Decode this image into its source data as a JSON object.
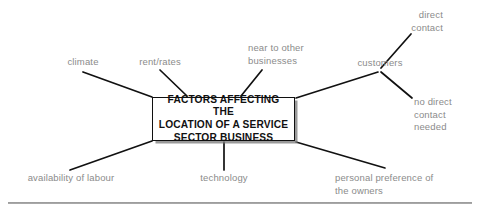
{
  "diagram": {
    "title": "Factors affecting the location of a service sector business",
    "type": "spider-mind-map",
    "center": {
      "label": "FACTORS AFFECTING THE\nLOCATION OF A SERVICE\nSECTOR BUSINESS",
      "style": "bold-uppercase-boxed-with-shadow"
    },
    "branches": [
      {
        "id": "climate",
        "label": "climate",
        "align": "center"
      },
      {
        "id": "rent-rates",
        "label": "rent/rates",
        "align": "center"
      },
      {
        "id": "near-to-other-businesses",
        "label": "near to other\nbusinesses",
        "align": "left"
      },
      {
        "id": "customers",
        "label": "customers",
        "align": "center"
      },
      {
        "id": "direct-contact",
        "label": "direct\ncontact",
        "align": "right"
      },
      {
        "id": "no-direct-contact-needed",
        "label": "no direct\ncontact\nneeded",
        "align": "left"
      },
      {
        "id": "availability-of-labour",
        "label": "availability of labour",
        "align": "center"
      },
      {
        "id": "technology",
        "label": "technology",
        "align": "center"
      },
      {
        "id": "personal-preference",
        "label": "personal preference of\nthe owners",
        "align": "left"
      }
    ],
    "colors": {
      "label_text": "#8b8b8b",
      "center_text": "#111111",
      "connector": "#111111",
      "box_border": "#101010",
      "box_fill": "#ffffff",
      "rule": "#9a9a9a",
      "background": "#ffffff"
    }
  }
}
